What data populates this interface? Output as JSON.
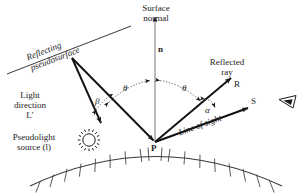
{
  "diagram": {
    "stroke_color": "#1a1a1a",
    "background": "#ffffff",
    "labels": {
      "surface_normal": "Surface\nnormal",
      "surface_normal_line1": "Surface",
      "surface_normal_line2": "normal",
      "normal_vector": "n",
      "reflecting_pseudosurface_line1": "Reflecting",
      "reflecting_pseudosurface_line2": "pseudosurface",
      "light_direction_line1": "Light",
      "light_direction_line2": "direction",
      "light_direction_symbol": "Lʹ",
      "pseudolight_line1": "Pseudolight",
      "pseudolight_line2": "source (l)",
      "reflected_ray_line1": "Reflected",
      "reflected_ray_line2": "ray",
      "reflected_vector": "R",
      "sight_vector": "S",
      "line_of_sight": "Line of sight",
      "point_p": "P",
      "angle_theta_left": "θ",
      "angle_theta_right": "θ",
      "angle_beta": "β",
      "angle_alpha": "α"
    },
    "icons": {
      "sun": "pseudolight-sun-icon",
      "eye": "observer-eye-icon"
    },
    "geometry": {
      "point_p": [
        155,
        142
      ],
      "pseudosurface_vertex": [
        72,
        58
      ],
      "normal_top": [
        155,
        15
      ],
      "reflected_tip": [
        232,
        77
      ],
      "sight_tip": [
        249,
        107
      ],
      "light_tip": [
        101,
        122
      ]
    }
  }
}
